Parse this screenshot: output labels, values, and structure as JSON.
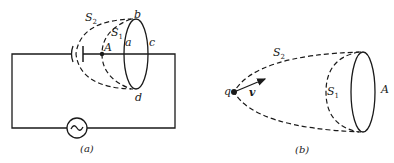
{
  "figure_a": {
    "caption": "(a)",
    "labels": {
      "S2": "S",
      "S2_sub": "2",
      "S1": "S",
      "S1_sub": "1",
      "A": "A",
      "a": "a",
      "b": "b",
      "c": "c",
      "d": "d"
    },
    "components": [
      "capacitor",
      "ac-source",
      "closed-loop-abcd",
      "point-A",
      "surface-S1",
      "surface-S2"
    ]
  },
  "figure_b": {
    "caption": "(b)",
    "labels": {
      "S2": "S",
      "S2_sub": "2",
      "S1": "S",
      "S1_sub": "1",
      "A": "A",
      "q": "q",
      "v": "v"
    },
    "components": [
      "point-charge-q",
      "velocity-vector-v",
      "loop-A",
      "surface-S1",
      "surface-S2"
    ]
  }
}
